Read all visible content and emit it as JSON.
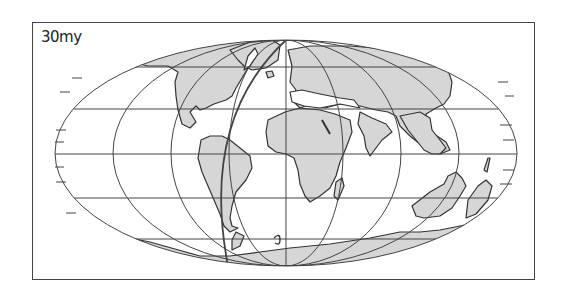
{
  "map": {
    "label": "30my",
    "projection": "Mollweide (oval equal-area)",
    "colors": {
      "land": "#d6d6d6",
      "outline": "#333333",
      "graticule": "#444444",
      "ocean": "#ffffff"
    },
    "features": [
      "North America",
      "Greenland",
      "South America",
      "Europe",
      "Asia",
      "Africa",
      "Arabia",
      "India",
      "Madagascar",
      "Australia",
      "Antarctica"
    ]
  }
}
